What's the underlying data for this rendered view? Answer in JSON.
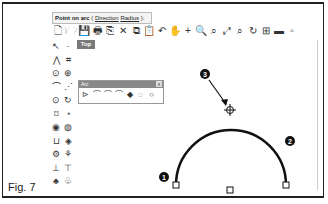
{
  "command_line": {
    "prompt": "Point on arc",
    "options_open": " ( ",
    "option_direction": "Direction",
    "option_radius": "Radius",
    "options_close": " ):"
  },
  "toolbar": {
    "icons": [
      "new-file-icon",
      "open-folder-icon",
      "save-icon",
      "print-icon",
      "import-icon",
      "cut-icon",
      "copy-icon",
      "paste-icon",
      "undo-icon",
      "pan-hand-icon",
      "zoom-dynamic-icon",
      "zoom-window-icon",
      "zoom-extents-icon",
      "zoom-all-icon",
      "zoom-selected-icon",
      "rotate-view-icon",
      "four-viewports-icon",
      "grid-icon",
      "render-icon"
    ],
    "glyphs": [
      "🗋",
      "🗁",
      "💾",
      "🖶",
      "⎘",
      "✕",
      "⧉",
      "📋",
      "↶",
      "✋",
      "+",
      "🔍",
      "⌕",
      "⤢",
      "⌕",
      "↻",
      "⊞",
      "▬",
      "▫"
    ]
  },
  "sidebar": {
    "rows": [
      [
        "↖",
        "·"
      ],
      [
        "⋀",
        "⌗"
      ],
      [
        "⊙",
        "⊕"
      ],
      [
        "⌒",
        "⋰"
      ],
      [
        "⊙",
        "↻"
      ],
      [
        "⌑",
        "◔"
      ],
      [
        "◉",
        "◍"
      ],
      [
        "⊔",
        "◈"
      ],
      [
        "⚙",
        "⚘"
      ],
      [
        "⊥",
        "⊤"
      ],
      [
        "♣",
        "♧"
      ]
    ]
  },
  "viewport": {
    "tab_label": "Top"
  },
  "arc_panel": {
    "title": "Arc",
    "close_glyph": "x",
    "tools": [
      "⊳",
      "⌒",
      "⌒",
      "⌒",
      "◆",
      "◌",
      "○"
    ]
  },
  "callouts": {
    "c1": "1",
    "c2": "2",
    "c3": "3"
  },
  "caption": "Fig. 7",
  "colors": {
    "frame": "#222222",
    "arc": "#111111",
    "tab_bg": "#7a7a7a"
  }
}
